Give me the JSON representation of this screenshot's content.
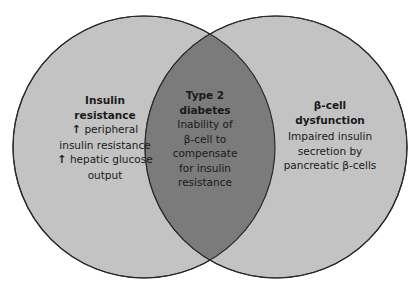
{
  "diagram": {
    "type": "venn",
    "colors": {
      "background": "#ffffff",
      "circle_fill": "#c3c3c3",
      "overlap_fill": "#7b7b7b",
      "outline": "#2a2a2a",
      "text": "#1a1a1a"
    },
    "left_circle": {
      "title_lines": [
        "Insulin",
        "resistance"
      ],
      "items": [
        {
          "icon": "up-arrow-icon",
          "arrow": "🡅",
          "lines": [
            "peripheral",
            "insulin resistance"
          ]
        },
        {
          "icon": "up-arrow-icon",
          "arrow": "🡅",
          "lines": [
            "hepatic glucose",
            "output"
          ]
        }
      ]
    },
    "overlap": {
      "title_lines": [
        "Type 2",
        "diabetes"
      ],
      "body_lines": [
        "Inability of",
        "β-cell to",
        "compensate",
        "for insulin",
        "resistance"
      ]
    },
    "right_circle": {
      "title_lines": [
        "β-cell",
        "dysfunction"
      ],
      "body_lines": [
        "Impaired insulin",
        "secretion by",
        "pancreatic β-cells"
      ]
    }
  }
}
